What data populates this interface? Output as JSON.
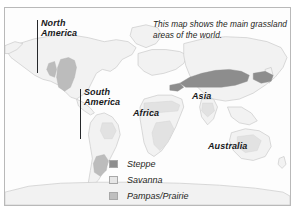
{
  "figure": {
    "caption": "This map shows the main grassland areas of the world.",
    "background_color": "#fdfdfd",
    "border_color": "#b9b9b9"
  },
  "map": {
    "land_fill": "#f0f0f0",
    "land_stroke": "#c9c9c9",
    "labels": [
      {
        "name": "north-america",
        "text": "North\nAmerica",
        "x": 36,
        "y": 10,
        "leader": {
          "x": 32,
          "y": 12,
          "height": 53
        }
      },
      {
        "name": "south-america",
        "text": "South\nAmerica",
        "x": 79,
        "y": 79,
        "leader": {
          "x": 75,
          "y": 81,
          "height": 50
        }
      },
      {
        "name": "africa",
        "text": "Africa",
        "x": 128,
        "y": 100,
        "leader": null
      },
      {
        "name": "asia",
        "text": "Asia",
        "x": 187,
        "y": 83,
        "leader": null
      },
      {
        "name": "australia",
        "text": "Australia",
        "x": 203,
        "y": 133,
        "leader": null
      }
    ]
  },
  "legend": {
    "items": [
      {
        "label": "Steppe",
        "color": "#8d8d8d",
        "swatch_name": "legend-swatch-steppe"
      },
      {
        "label": "Savanna",
        "color": "#e6e6e6",
        "swatch_name": "legend-swatch-savanna"
      },
      {
        "label": "Pampas/Prairie",
        "color": "#bfbfbf",
        "swatch_name": "legend-swatch-pampas-prairie"
      }
    ]
  },
  "regions": {
    "steppe_color": "#8d8d8d",
    "savanna_color": "#e2e2e2",
    "prairie_color": "#bcbcbc"
  }
}
